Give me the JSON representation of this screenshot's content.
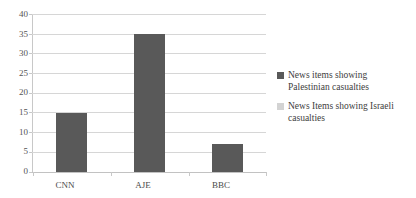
{
  "chart_data": {
    "type": "bar",
    "title": "",
    "xlabel": "",
    "ylabel": "",
    "categories": [
      "CNN",
      "AJE",
      "BBC"
    ],
    "series": [
      {
        "name": "News items showing Palestinian casualties",
        "values": [
          15,
          35,
          7
        ],
        "color": "#595959"
      },
      {
        "name": "News Items showing Israeli casualties",
        "values": [
          0,
          0,
          0
        ],
        "color": "#d3d3d3"
      }
    ],
    "ylim": [
      0,
      40
    ],
    "yticks": [
      0,
      5,
      10,
      15,
      20,
      25,
      30,
      35,
      40
    ],
    "ytick_labels": [
      "0",
      "5",
      "10",
      "15",
      "20",
      "25",
      "30",
      "35",
      "40"
    ],
    "grid": true,
    "legend_position": "right"
  },
  "legend": {
    "entries": [
      {
        "label_line1": "News items showing",
        "label_line2": "Palestinian casualties",
        "full": "News items showing Palestinian casualties",
        "color": "#595959"
      },
      {
        "label_line1": "News Items showing Israeli",
        "label_line2": "casualties",
        "full": "News Items showing Israeli casualties",
        "color": "#d3d3d3"
      }
    ]
  },
  "colors": {
    "series1": "#595959",
    "series2": "#d3d3d3",
    "gridline": "#d6d6d6",
    "axis": "#c8c8c8",
    "text": "#404040",
    "background": "#ffffff"
  }
}
